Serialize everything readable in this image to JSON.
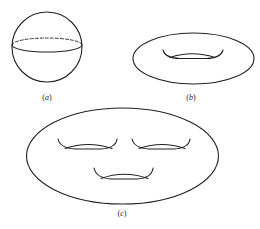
{
  "figure": {
    "stroke_color": "#222222",
    "background": "#ffffff",
    "panels": [
      {
        "id": "a",
        "label": "(a)",
        "label_open": "(",
        "label_letter": "a",
        "label_close": ")",
        "shape": "sphere",
        "genus": 0
      },
      {
        "id": "b",
        "label": "(b)",
        "label_open": "(",
        "label_letter": "b",
        "label_close": ")",
        "shape": "torus",
        "genus": 1
      },
      {
        "id": "c",
        "label": "(c)",
        "label_open": "(",
        "label_letter": "c",
        "label_close": ")",
        "shape": "three-holed surface",
        "genus": 3
      }
    ]
  }
}
